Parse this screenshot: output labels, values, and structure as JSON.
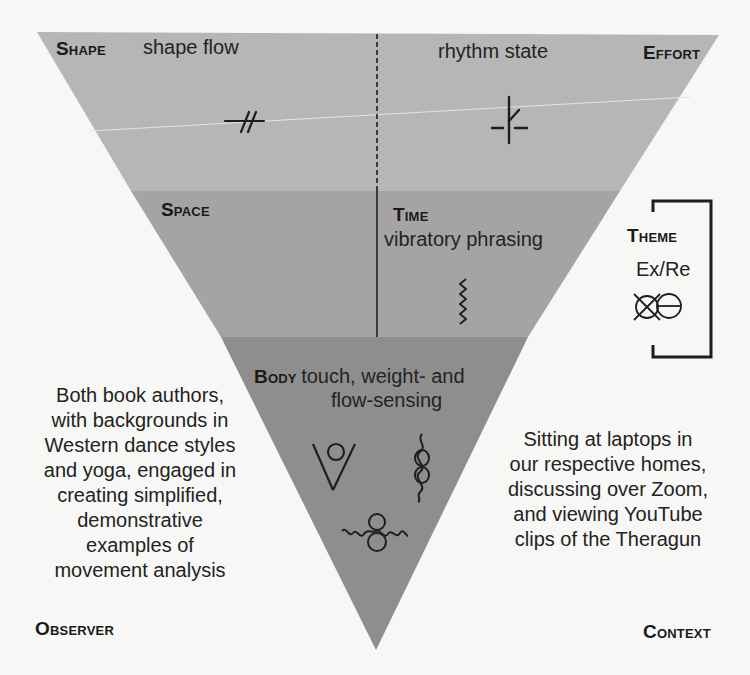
{
  "diagram": {
    "type": "inverted-triangle-framework",
    "colors": {
      "background": "#f7f7f5",
      "band_top": "#b6b6b6",
      "band_middle": "#a4a4a4",
      "band_bottom": "#8e8e8e",
      "ink": "#1e1e1e"
    },
    "bands": {
      "top": {
        "left": {
          "category": "Shape",
          "detail": "shape flow",
          "symbol": "shape-flow-symbol"
        },
        "right": {
          "category": "Effort",
          "detail": "rhythm state",
          "symbol": "rhythm-state-symbol"
        },
        "divider": "dashed"
      },
      "middle": {
        "left": {
          "category": "Space",
          "detail": ""
        },
        "right": {
          "category": "Time",
          "detail": "vibratory phrasing",
          "symbol": "vibratory-zigzag-symbol"
        },
        "divider": "solid"
      },
      "bottom": {
        "category": "Body",
        "detail_line1": "touch, weight- and",
        "detail_line2": "flow-sensing",
        "symbols": [
          "touch-symbol",
          "weight-sensing-symbol",
          "flow-sensing-symbol"
        ]
      }
    },
    "theme": {
      "label": "Theme",
      "detail": "Ex/Re",
      "symbol": "exertion-recuperation-symbol"
    },
    "observer": {
      "label": "Observer",
      "lines": [
        "Both book authors,",
        "with backgrounds in",
        "Western dance styles",
        "and yoga, engaged in",
        "creating simplified,",
        "demonstrative",
        "examples of",
        "movement analysis"
      ]
    },
    "context": {
      "label": "Context",
      "lines": [
        "Sitting at laptops in",
        "our respective homes,",
        "discussing over Zoom,",
        "and viewing YouTube",
        "clips of the Theragun"
      ]
    }
  }
}
